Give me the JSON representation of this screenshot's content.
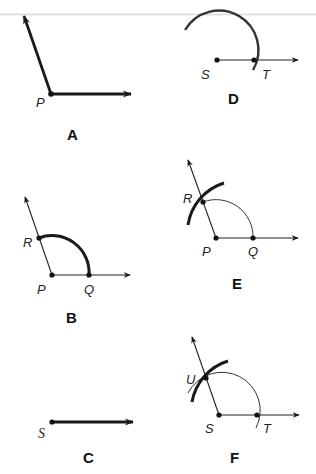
{
  "panels": {
    "A": {
      "label": "A",
      "points": {
        "P": "P"
      },
      "description": "Given angle with vertex P"
    },
    "B": {
      "label": "B",
      "points": {
        "P": "P",
        "Q": "Q",
        "R": "R"
      },
      "description": "Arc centered at P intersects sides at Q and R"
    },
    "C": {
      "label": "C",
      "points": {
        "S": "S"
      },
      "description": "Ray drawn from point S"
    },
    "D": {
      "label": "D",
      "points": {
        "S": "S",
        "T": "T"
      },
      "description": "Arc with same radius centered at S intersects ray at T"
    },
    "E": {
      "label": "E",
      "points": {
        "P": "P",
        "Q": "Q",
        "R": "R"
      },
      "description": "Compass set to distance QR, arc drawn centered at Q through R"
    },
    "F": {
      "label": "F",
      "points": {
        "S": "S",
        "T": "T",
        "U": "U"
      },
      "description": "Arc centered at T intersects first arc at U; ray SU completes angle"
    }
  },
  "colors": {
    "ink": "#1a1a1a",
    "background": "#ffffff",
    "top_rule": "#d9d9d9"
  }
}
